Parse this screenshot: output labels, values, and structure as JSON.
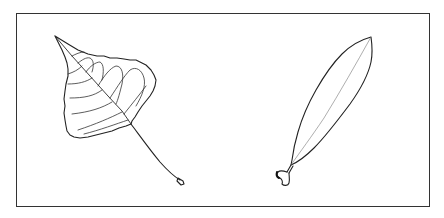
{
  "figure": {
    "frame_color": "#333333",
    "background_color": "#ffffff",
    "line_color": "#222222"
  },
  "leaves": [
    {
      "id": "left",
      "shape": "deltoid / heart-shaped leaf with serrated margin, pinnate veins and long petiole"
    },
    {
      "id": "right",
      "shape": "lanceolate narrow leaf with single midrib and short stipulate petiole"
    }
  ]
}
